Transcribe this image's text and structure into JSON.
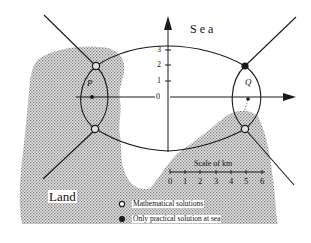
{
  "labels": {
    "sea": "Sea",
    "land": "Land",
    "point_p": "P",
    "point_q": "Q"
  },
  "y_axis": {
    "ticks": [
      "0",
      "1",
      "2",
      "3"
    ]
  },
  "scale_bar": {
    "title": "Scale of km",
    "ticks": [
      "0",
      "1",
      "2",
      "3",
      "4",
      "5",
      "6"
    ]
  },
  "legend": {
    "items": [
      {
        "symbol": "hollow-circle",
        "label": "Mathematical solutions"
      },
      {
        "symbol": "filled-circle",
        "label": "Only practical solution at sea"
      }
    ]
  },
  "colors": {
    "land_fill": "#b8b8b8",
    "line": "#1a1a1a",
    "background": "#ffffff"
  }
}
